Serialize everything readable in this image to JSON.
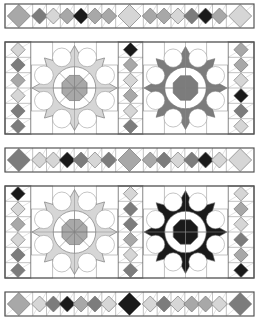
{
  "colors": {
    "outline": "#555555",
    "grid": "#9a9a9a",
    "background": "#ffffff",
    "shades": {
      "L": "#d6d6d6",
      "M": "#a8a8a8",
      "D": "#7c7c7c",
      "K": "#1a1a1a"
    }
  },
  "strips": [
    {
      "name": "top-strip",
      "y": 4,
      "shades": [
        "M",
        "D",
        "L",
        "M",
        "K",
        "M",
        "M",
        "L",
        "M",
        "M",
        "L",
        "D",
        "K",
        "M",
        "L"
      ],
      "big": [
        0,
        7,
        14
      ]
    },
    {
      "name": "middle-strip",
      "y": 148,
      "shades": [
        "D",
        "L",
        "L",
        "K",
        "D",
        "L",
        "D",
        "M",
        "M",
        "D",
        "L",
        "D",
        "K",
        "L",
        "L"
      ],
      "big": [
        0,
        7,
        14
      ]
    },
    {
      "name": "bottom-strip",
      "y": 292,
      "shades": [
        "M",
        "L",
        "D",
        "K",
        "M",
        "D",
        "L",
        "K",
        "L",
        "D",
        "L",
        "M",
        "M",
        "L",
        "D"
      ],
      "big": [
        0,
        7,
        14
      ]
    }
  ],
  "block_rows": [
    {
      "name": "block-row-1",
      "y": 42,
      "columns": [
        [
          "L",
          "D",
          "M",
          "L",
          "D",
          "D"
        ],
        [
          "K",
          "M",
          "L",
          "M",
          "L",
          "D"
        ],
        [
          "M",
          "M",
          "L",
          "K",
          "D",
          "L"
        ]
      ],
      "stars": [
        {
          "ring": "L",
          "center": "M",
          "center_lines": true
        },
        {
          "ring": "D",
          "center": "D",
          "center_lines": false
        }
      ]
    },
    {
      "name": "block-row-2",
      "y": 186,
      "columns": [
        [
          "K",
          "L",
          "M",
          "L",
          "D",
          "D"
        ],
        [
          "L",
          "D",
          "D",
          "M",
          "L",
          "D"
        ],
        [
          "L",
          "M",
          "L",
          "D",
          "M",
          "K"
        ]
      ],
      "stars": [
        {
          "ring": "L",
          "center": "M",
          "center_lines": true
        },
        {
          "ring": "K",
          "center": "K",
          "center_lines": false
        }
      ]
    }
  ]
}
